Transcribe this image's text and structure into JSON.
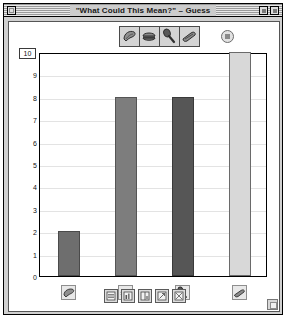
{
  "window": {
    "title": "\"What Could This Mean?\" – Guess",
    "close_icon": "close-box",
    "zoom_icon": "zoom-box",
    "collapse_icon": "collapse-box",
    "resize_icon": "grow-box"
  },
  "palette": {
    "items": [
      {
        "name": "shell-tool",
        "icon": "shell-icon"
      },
      {
        "name": "burger-tool",
        "icon": "burger-icon"
      },
      {
        "name": "spoon-tool",
        "icon": "spoon-icon"
      },
      {
        "name": "shoe-tool",
        "icon": "shoe-icon"
      }
    ],
    "help_label": "?",
    "help_icon": "help-icon"
  },
  "axis": {
    "y_max_value": "10",
    "y_ticks": [
      "10",
      "9",
      "8",
      "7",
      "6",
      "5",
      "4",
      "3",
      "2",
      "1",
      "0"
    ]
  },
  "toolbar": {
    "buttons": [
      {
        "name": "list-view-button",
        "icon": "list-view-icon"
      },
      {
        "name": "chart-view-button",
        "icon": "chart-view-icon"
      },
      {
        "name": "split-view-button",
        "icon": "split-view-icon"
      },
      {
        "name": "export-button",
        "icon": "export-icon"
      },
      {
        "name": "settings-button",
        "icon": "settings-icon"
      }
    ]
  },
  "chart_data": {
    "type": "bar",
    "title": "\"What Could This Mean?\" – Guess",
    "xlabel": "",
    "ylabel": "",
    "ylim": [
      0,
      10
    ],
    "yticks": [
      0,
      1,
      2,
      3,
      4,
      5,
      6,
      7,
      8,
      9,
      10
    ],
    "grid": true,
    "legend": "none",
    "categories": [
      "shell",
      "burger",
      "spoon",
      "shoe"
    ],
    "category_icons": [
      "shell-icon",
      "burger-icon",
      "spoon-icon",
      "shoe-icon"
    ],
    "values": [
      2,
      8,
      8,
      10
    ],
    "bar_colors": [
      "#6e6e6e",
      "#7d7d7d",
      "#565656",
      "#d8d8d8"
    ],
    "bar_border_colors": [
      "#4a4a4a",
      "#555555",
      "#3a3a3a",
      "#6a6a6a"
    ]
  }
}
